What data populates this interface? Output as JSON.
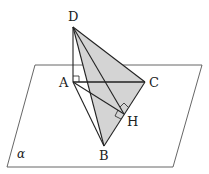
{
  "diagram": {
    "type": "3D geometry: tetrahedron D-ABC with DA perpendicular to plane alpha",
    "plane": {
      "label": "α",
      "corners": [
        [
          35,
          65
        ],
        [
          202,
          65
        ],
        [
          173,
          167
        ],
        [
          7,
          167
        ]
      ]
    },
    "points": {
      "D": {
        "label": "D",
        "x": 73,
        "y": 27
      },
      "A": {
        "label": "A",
        "x": 73,
        "y": 82
      },
      "C": {
        "label": "C",
        "x": 145,
        "y": 82
      },
      "B": {
        "label": "B",
        "x": 104,
        "y": 146
      },
      "H": {
        "label": "H",
        "x": 124,
        "y": 114
      }
    },
    "shaded_faces": [
      "DBC"
    ],
    "segments": [
      "DA",
      "DB",
      "DC",
      "DH",
      "AC",
      "AB",
      "AH",
      "BC"
    ],
    "right_angle_marks": [
      "DAC at A",
      "DHC at H",
      "AHB at H"
    ],
    "colors": {
      "shade": "#d4d4d4",
      "line": "#222222",
      "plane": "#555555"
    }
  }
}
